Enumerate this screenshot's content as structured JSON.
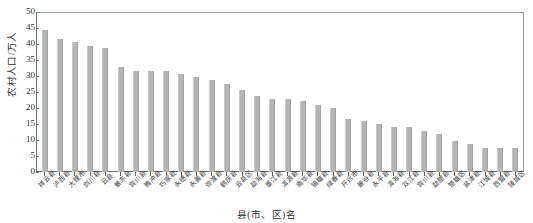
{
  "chart_data": {
    "type": "bar",
    "title": "",
    "xlabel": "县(市、区)名",
    "ylabel": "农村人口/万人",
    "ylim": [
      0,
      50
    ],
    "yticks": [
      0,
      5,
      10,
      15,
      20,
      25,
      30,
      35,
      40,
      45,
      50
    ],
    "grid": false,
    "legend": null,
    "bar_color": "#b4b4b4",
    "axis_color": "#6e6e6e",
    "categories": [
      "祥云县",
      "泸西县",
      "大理市",
      "剑川县",
      "云县",
      "景东县",
      "宾川县",
      "腾冲县",
      "巧家县",
      "永德县",
      "永善县",
      "弥渡县",
      "鹤庆县",
      "云县区",
      "勐海县",
      "墨江县",
      "洱源县",
      "南华县",
      "镇雄县",
      "绿春县",
      "开远市",
      "景谷县",
      "永平县",
      "洱海县",
      "双江县",
      "宾川县",
      "勐腊县",
      "楚雄区",
      "盐津县",
      "江城县",
      "西盟县",
      "陵城区"
    ],
    "values": [
      44.8,
      41.9,
      40.8,
      39.7,
      39.0,
      32.9,
      31.9,
      31.9,
      31.9,
      30.7,
      29.8,
      29.0,
      27.8,
      25.9,
      24.0,
      23.0,
      22.9,
      22.4,
      21.0,
      20.0,
      16.8,
      16.0,
      15.0,
      14.0,
      14.0,
      12.8,
      11.9,
      9.9,
      8.9,
      7.7,
      7.7,
      7.7
    ]
  }
}
